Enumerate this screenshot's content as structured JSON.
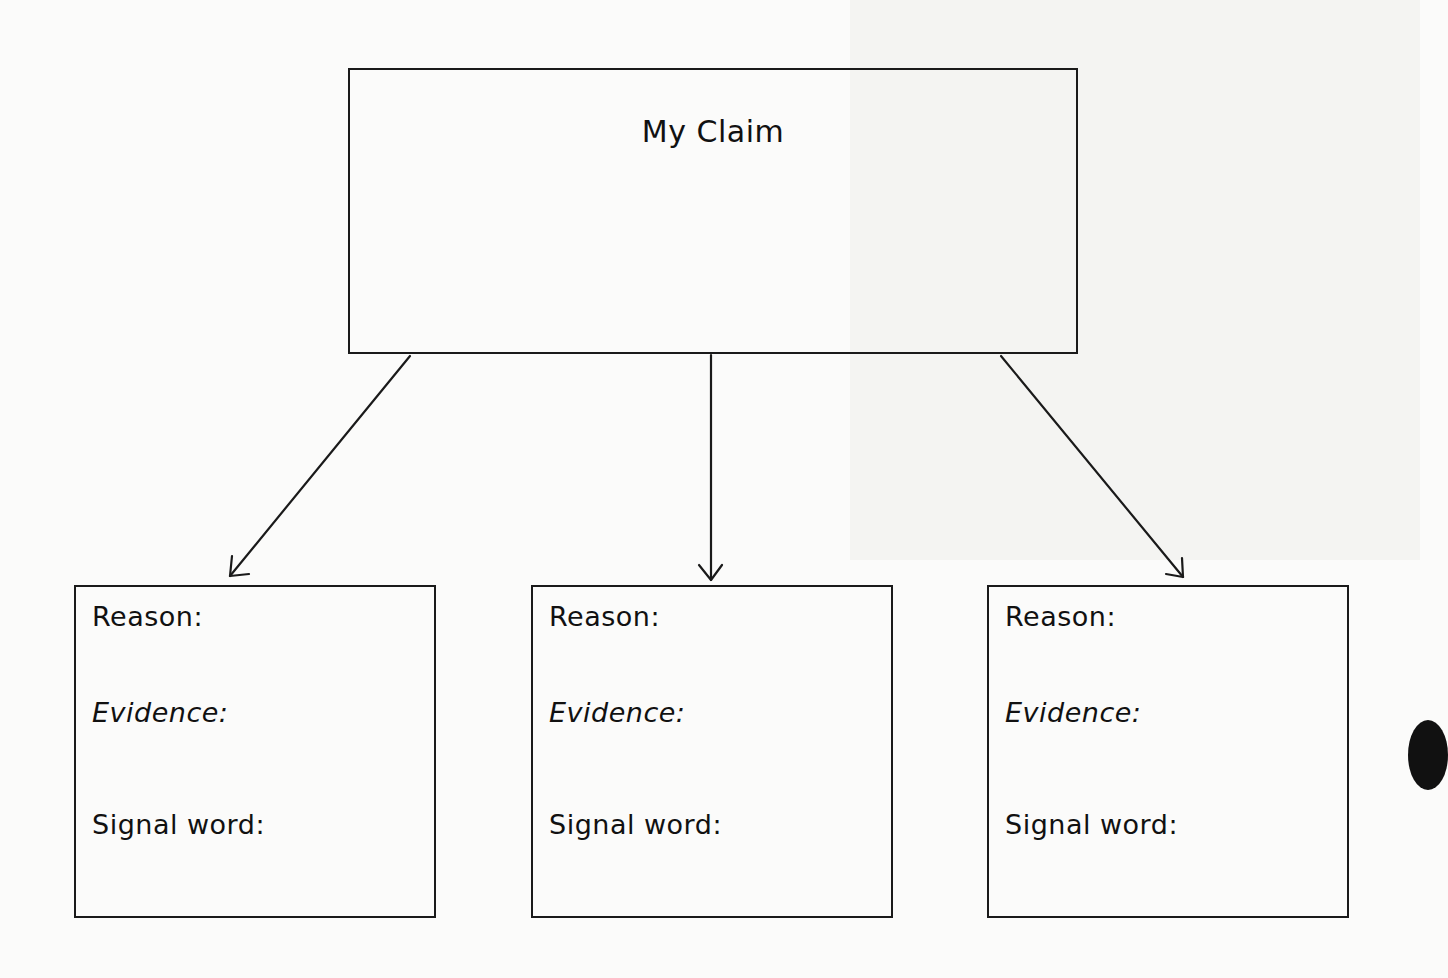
{
  "diagram": {
    "claim": {
      "title": "My Claim"
    },
    "reason_boxes": [
      {
        "reason_label": "Reason:",
        "evidence_label": "Evidence:",
        "signal_label": "Signal word:"
      },
      {
        "reason_label": "Reason:",
        "evidence_label": "Evidence:",
        "signal_label": "Signal word:"
      },
      {
        "reason_label": "Reason:",
        "evidence_label": "Evidence:",
        "signal_label": "Signal word:"
      }
    ],
    "arrows": [
      {
        "from": "claim",
        "to": "reason_box_1"
      },
      {
        "from": "claim",
        "to": "reason_box_2"
      },
      {
        "from": "claim",
        "to": "reason_box_3"
      }
    ],
    "colors": {
      "line": "#1a1a1a",
      "background": "#fbfbfa"
    }
  }
}
